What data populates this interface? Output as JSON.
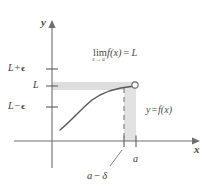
{
  "figure": {
    "kind": "limit-epsilon-delta-diagram",
    "background_color": "#ffffff",
    "axes": {
      "x_axis_label": "x",
      "y_axis_label": "y",
      "axis_color": "#6e6e6e"
    },
    "y_ticks": [
      {
        "name": "L-plus-epsilon",
        "base": "L",
        "operator": "+",
        "offset": "ϵ",
        "y_px": 69
      },
      {
        "name": "L",
        "base": "L",
        "operator": "",
        "offset": "",
        "y_px": 86
      },
      {
        "name": "L-minus-epsilon",
        "base": "L",
        "operator": "−",
        "offset": "ϵ",
        "y_px": 107
      }
    ],
    "x_ticks": [
      {
        "name": "a-minus-delta",
        "label": "",
        "x_px": 124
      },
      {
        "name": "a",
        "label": "a",
        "x_px": 136
      }
    ],
    "annotations": {
      "limit_expression": {
        "operator": "lim",
        "subscript": "x → a⁻",
        "function": "f(x)",
        "equals": "=",
        "value": "L"
      },
      "curve_label": {
        "y": "y",
        "equals": "=",
        "function": "f(x)"
      },
      "a_minus_delta_label": {
        "a": "a",
        "operator": "−",
        "delta": "δ"
      }
    },
    "colors": {
      "curve": "#585858",
      "band_horizontal": "#dedede",
      "band_vertical": "#e2e2e2",
      "dashed_line": "#8c8c8c",
      "open_circle_stroke": "#6a6a6a",
      "text": "#3f3f3f"
    }
  }
}
